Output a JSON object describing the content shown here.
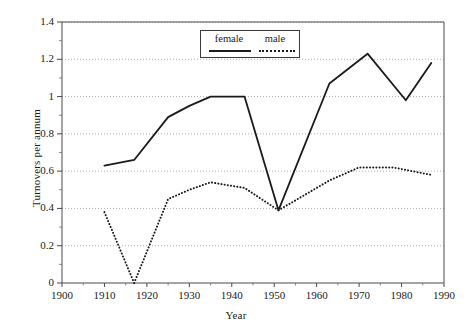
{
  "chart_data": {
    "type": "line",
    "title": "",
    "xlabel": "Year",
    "ylabel": "Turnovers per annum",
    "xlim": [
      1900,
      1990
    ],
    "ylim": [
      0,
      1.4
    ],
    "xticks": [
      "1900",
      "1910",
      "1920",
      "1930",
      "1940",
      "1950",
      "1960",
      "1970",
      "1980",
      "1990"
    ],
    "xtick_values": [
      1900,
      1910,
      1920,
      1930,
      1940,
      1950,
      1960,
      1970,
      1980,
      1990
    ],
    "yticks": [
      "0",
      "0.2",
      "0.4",
      "0.6",
      "0.8",
      "1",
      "1.2",
      "1.4"
    ],
    "ytick_values": [
      0,
      0.2,
      0.4,
      0.6,
      0.8,
      1.0,
      1.2,
      1.4
    ],
    "grid": "horizontal-dotted",
    "legend_position": "top-center",
    "series": [
      {
        "name": "female",
        "style": "solid",
        "color": "#1a1a1a",
        "x": [
          1910,
          1917,
          1925,
          1930,
          1935,
          1943,
          1951,
          1963,
          1972,
          1981,
          1987
        ],
        "values": [
          0.63,
          0.66,
          0.89,
          0.95,
          1.0,
          1.0,
          0.39,
          1.07,
          1.23,
          0.98,
          1.18
        ]
      },
      {
        "name": "male",
        "style": "dotted",
        "color": "#1a1a1a",
        "x": [
          1910,
          1917,
          1925,
          1930,
          1935,
          1943,
          1951,
          1963,
          1970,
          1978,
          1987
        ],
        "values": [
          0.38,
          0.0,
          0.45,
          0.5,
          0.54,
          0.51,
          0.39,
          0.55,
          0.62,
          0.62,
          0.58
        ]
      }
    ]
  },
  "legend": {
    "female_label": "female",
    "male_label": "male"
  },
  "axes": {
    "x_title": "Year",
    "y_title": "Turnovers per annum"
  }
}
